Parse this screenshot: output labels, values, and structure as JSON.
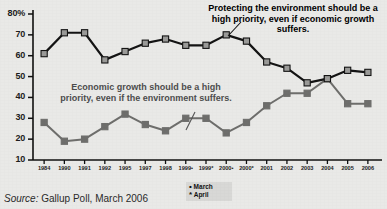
{
  "source": {
    "prefix": "Source:",
    "text": " Gallup Poll, March 2006"
  },
  "legend": {
    "title": "legend",
    "items": [
      {
        "marker": "•",
        "label": "March"
      },
      {
        "marker": "*",
        "label": "April"
      }
    ]
  },
  "callouts": {
    "environment": "Protecting the environment should be a high priority, even if economic growth suffers.",
    "economy": "Economic growth should be a high priority, even if the environment suffers."
  },
  "axis": {
    "y_unit_label": "80%",
    "y_ticks": [
      "80%",
      "70",
      "60",
      "50",
      "40",
      "30",
      "20",
      "10"
    ]
  },
  "colors": {
    "environment_line": "#141414",
    "environment_marker": "#9a9a98",
    "economy_line": "#6e6e6c",
    "economy_marker": "#6e6e6c",
    "background": "#e9e9e7",
    "axis": "#111111"
  },
  "chart_data": {
    "type": "line",
    "title": "",
    "subtitle": "",
    "xlabel": "",
    "ylabel": "",
    "ylim": [
      10,
      80
    ],
    "yticks": [
      10,
      20,
      30,
      40,
      50,
      60,
      70,
      80
    ],
    "grid": false,
    "legend_position": "bottom-right",
    "categories": [
      "1984",
      "1990",
      "1991",
      "1992",
      "1995",
      "1997",
      "1998",
      "1999•",
      "1999*",
      "2000•",
      "2000*",
      "2001",
      "2002",
      "2003",
      "2004",
      "2005",
      "2006"
    ],
    "series": [
      {
        "name": "Protecting the environment should be a high priority, even if economic growth suffers.",
        "short_name": "Environment",
        "values": [
          61,
          71,
          71,
          58,
          62,
          66,
          68,
          65,
          65,
          70,
          67,
          57,
          54,
          47,
          49,
          53,
          52
        ]
      },
      {
        "name": "Economic growth should be a high priority, even if the environment suffers.",
        "short_name": "Economic growth",
        "values": [
          28,
          19,
          20,
          26,
          32,
          27,
          24,
          30,
          30,
          23,
          28,
          36,
          42,
          42,
          49,
          37,
          37
        ]
      }
    ],
    "annotations": [
      "Protecting the environment should be a high priority, even if economic growth suffers.",
      "Economic growth should be a high priority, even if the environment suffers."
    ]
  }
}
